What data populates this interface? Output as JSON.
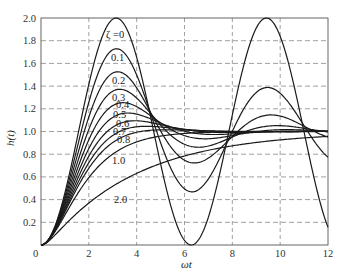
{
  "chart_data": {
    "type": "line",
    "title": "",
    "xlabel": "ωt",
    "ylabel": "h(t)",
    "xlim": [
      0,
      12
    ],
    "ylim": [
      0,
      2.0
    ],
    "grid": true,
    "grid_style": "dashed",
    "legend": "inline curve labels",
    "x_ticks": [
      "0",
      "2",
      "4",
      "6",
      "8",
      "10",
      "12"
    ],
    "y_ticks": [
      "0.2",
      "0.4",
      "0.6",
      "0.8",
      "1.0",
      "1.2",
      "1.4",
      "1.6",
      "1.8",
      "2.0"
    ],
    "origin_label": "0",
    "series_formula": "h(t) = 1 - e^{-ζωt}(cos(ω_d t) + ζ/√(1-ζ²) sin(ω_d t)), ω_n = 1",
    "series": [
      {
        "name": "ζ=0",
        "zeta": 0.0,
        "label": "ζ =0",
        "peak": 2.0,
        "peak_x": 3.14
      },
      {
        "name": "ζ=0.1",
        "zeta": 0.1,
        "label": "0.1",
        "peak": 1.73,
        "peak_x": 3.16
      },
      {
        "name": "ζ=0.2",
        "zeta": 0.2,
        "label": "0.2",
        "peak": 1.53,
        "peak_x": 3.21
      },
      {
        "name": "ζ=0.3",
        "zeta": 0.3,
        "label": "0.3",
        "peak": 1.37,
        "peak_x": 3.29
      },
      {
        "name": "ζ=0.4",
        "zeta": 0.4,
        "label": "0.4",
        "peak": 1.25,
        "peak_x": 3.43
      },
      {
        "name": "ζ=0.5",
        "zeta": 0.5,
        "label": "0.5",
        "peak": 1.16,
        "peak_x": 3.63
      },
      {
        "name": "ζ=0.6",
        "zeta": 0.6,
        "label": "0.6",
        "peak": 1.09,
        "peak_x": 3.93
      },
      {
        "name": "ζ=0.7",
        "zeta": 0.7,
        "label": "0.7",
        "peak": 1.05,
        "peak_x": 4.4
      },
      {
        "name": "ζ=0.8",
        "zeta": 0.8,
        "label": "0.8",
        "peak": 1.02,
        "peak_x": 5.24
      },
      {
        "name": "ζ=1.0",
        "zeta": 1.0,
        "label": "1.0",
        "peak": 1.0,
        "peak_x": 12
      },
      {
        "name": "ζ=2.0",
        "zeta": 2.0,
        "label": "2.0",
        "peak": 0.95,
        "peak_x": 12
      }
    ]
  },
  "labels": {
    "x_axis_title": "ωt",
    "y_axis_title": "h(t)",
    "origin": "0"
  }
}
